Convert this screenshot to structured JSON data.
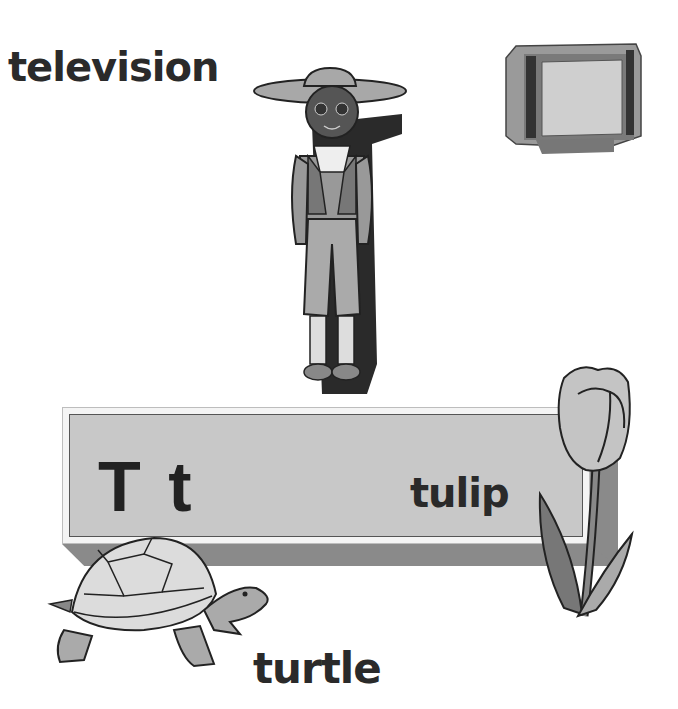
{
  "words": {
    "television": "television",
    "turtle": "turtle",
    "tulip": "tulip"
  },
  "banner": {
    "letters": "T t"
  },
  "pictures": [
    "boy-in-hat",
    "television-set",
    "turtle",
    "tulip"
  ]
}
